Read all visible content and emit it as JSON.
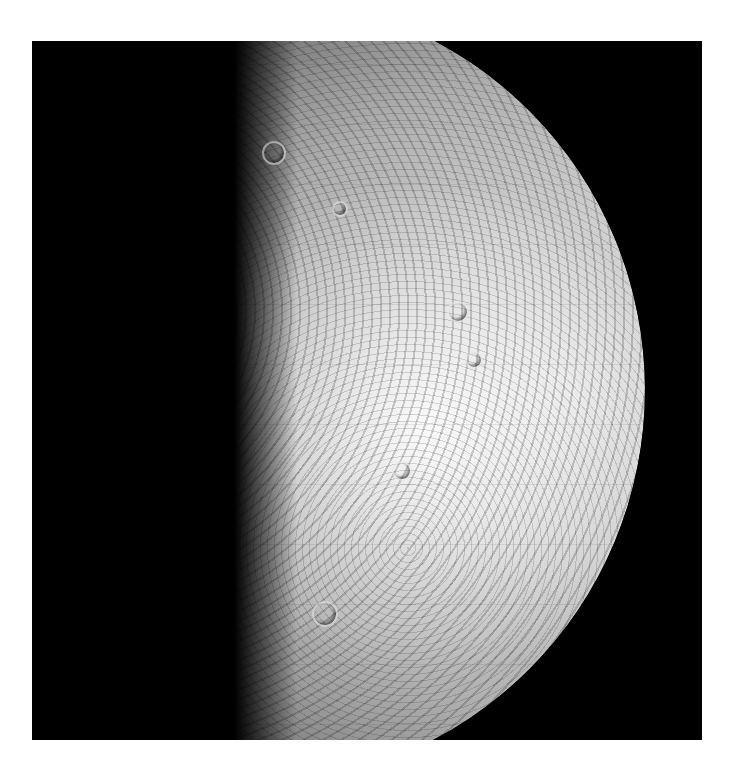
{
  "image": {
    "subject": "mercury-planet-photomosaic",
    "description": "Black-and-white photomosaic of the planet Mercury, illuminated from the right, shown against a black background inside a white page margin",
    "colors": {
      "page_background": "#ffffff",
      "space_background": "#000000",
      "surface_bright": "#f4f4f4",
      "surface_mid": "#8a8a8a"
    }
  }
}
